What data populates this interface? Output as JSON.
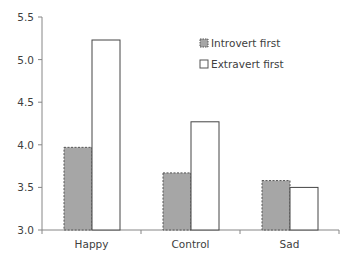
{
  "chart_data": {
    "type": "bar",
    "title": "",
    "xlabel": "",
    "ylabel": "",
    "categories": [
      "Happy",
      "Control",
      "Sad"
    ],
    "series": [
      {
        "name": "Introvert first",
        "values": [
          3.97,
          3.67,
          3.58
        ],
        "color": "#a6a6a6",
        "border": "dashed"
      },
      {
        "name": "Extravert first",
        "values": [
          5.23,
          4.27,
          3.5
        ],
        "color": "#ffffff",
        "border": "solid"
      }
    ],
    "ylim": [
      3.0,
      5.5
    ],
    "yticks": [
      "3.0",
      "3.5",
      "4.0",
      "4.5",
      "5.0",
      "5.5"
    ],
    "grid": false,
    "legend_position": "upper-right-inside"
  }
}
